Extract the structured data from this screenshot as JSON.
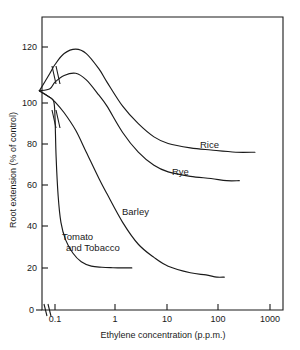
{
  "chart_data": {
    "type": "line",
    "title": "",
    "xlabel": "Ethylene concentration (p.p.m.)",
    "ylabel": "Root extension (% of control)",
    "xscale": "log",
    "xlim": [
      0.04,
      2000
    ],
    "ylim": [
      0,
      130
    ],
    "grid": false,
    "legend_position": "inline-labels",
    "axis_break": {
      "x_axis": true,
      "note": "break mark between 0 and 0.1 on x-axis",
      "curve_breaks": true
    },
    "xticks": [
      "0.1",
      "1",
      "10",
      "100",
      "1000"
    ],
    "xtick_values": [
      0.1,
      1,
      10,
      100,
      1000
    ],
    "yticks": [
      "0",
      "20",
      "40",
      "60",
      "80",
      "100",
      "120"
    ],
    "ytick_values": [
      0,
      20,
      40,
      60,
      80,
      100,
      120
    ],
    "origin_label": "0",
    "series": [
      {
        "name": "Rice",
        "label": "Rice",
        "points": [
          [
            0.05,
            100
          ],
          [
            0.08,
            108
          ],
          [
            0.1,
            112
          ],
          [
            0.15,
            117
          ],
          [
            0.25,
            119
          ],
          [
            0.4,
            117
          ],
          [
            0.7,
            110
          ],
          [
            1.0,
            104
          ],
          [
            2.0,
            93
          ],
          [
            4.0,
            85
          ],
          [
            8.0,
            79
          ],
          [
            15,
            76
          ],
          [
            40,
            74
          ],
          [
            100,
            73
          ],
          [
            300,
            72
          ],
          [
            700,
            72
          ]
        ]
      },
      {
        "name": "Rye",
        "label": "Rye",
        "points": [
          [
            0.05,
            100
          ],
          [
            0.08,
            101
          ],
          [
            0.1,
            104
          ],
          [
            0.15,
            107
          ],
          [
            0.25,
            108
          ],
          [
            0.4,
            105
          ],
          [
            0.7,
            98
          ],
          [
            1.0,
            93
          ],
          [
            2.0,
            81
          ],
          [
            4.0,
            72
          ],
          [
            8.0,
            66
          ],
          [
            15,
            63
          ],
          [
            40,
            61
          ],
          [
            100,
            60
          ],
          [
            200,
            59
          ],
          [
            350,
            59
          ]
        ]
      },
      {
        "name": "Barley",
        "label": "Barley",
        "points": [
          [
            0.05,
            100
          ],
          [
            0.08,
            97
          ],
          [
            0.1,
            95
          ],
          [
            0.15,
            90
          ],
          [
            0.25,
            82
          ],
          [
            0.4,
            72
          ],
          [
            0.7,
            60
          ],
          [
            1.0,
            53
          ],
          [
            2.0,
            40
          ],
          [
            4.0,
            30
          ],
          [
            8.0,
            24
          ],
          [
            15,
            20
          ],
          [
            40,
            17
          ],
          [
            80,
            16
          ],
          [
            130,
            15
          ],
          [
            180,
            15
          ]
        ]
      },
      {
        "name": "Tomato and Tobacco",
        "label": "Tomato and Tobacco",
        "points": [
          [
            0.05,
            100
          ],
          [
            0.08,
            97
          ],
          [
            0.095,
            95
          ],
          [
            0.1,
            88
          ],
          [
            0.105,
            70
          ],
          [
            0.115,
            52
          ],
          [
            0.13,
            40
          ],
          [
            0.16,
            32
          ],
          [
            0.22,
            26
          ],
          [
            0.32,
            22
          ],
          [
            0.5,
            20
          ],
          [
            0.8,
            19.5
          ],
          [
            1.3,
            19.3
          ],
          [
            2.0,
            19.2
          ],
          [
            3.0,
            19.2
          ]
        ]
      }
    ]
  },
  "labels": {
    "rice": "Rice",
    "rye": "Rye",
    "barley": "Barley",
    "tomato_tobacco_line1": "Tomato",
    "tomato_tobacco_line2": "and Tobacco"
  },
  "axis": {
    "x_title": "Ethylene concentration (p.p.m.)",
    "y_title": "Root extension (% of control)",
    "x_tick_0": "0.1",
    "x_tick_1": "1",
    "x_tick_2": "10",
    "x_tick_3": "100",
    "x_tick_4": "1000",
    "y_tick_0": "0",
    "y_tick_20": "20",
    "y_tick_40": "40",
    "y_tick_60": "60",
    "y_tick_80": "80",
    "y_tick_100": "100",
    "y_tick_120": "120"
  },
  "colors": {
    "ink": "#1a1a1a",
    "background": "#ffffff"
  }
}
